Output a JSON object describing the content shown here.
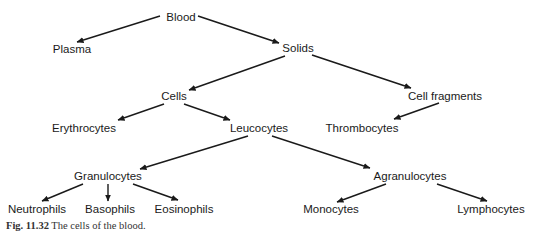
{
  "diagram": {
    "title": "The cells of the blood",
    "nodes": {
      "blood": {
        "label": "Blood",
        "x": 181,
        "y": 17
      },
      "plasma": {
        "label": "Plasma",
        "x": 72,
        "y": 49
      },
      "solids": {
        "label": "Solids",
        "x": 298,
        "y": 48
      },
      "cells": {
        "label": "Cells",
        "x": 174,
        "y": 96
      },
      "cell_fragments": {
        "label": "Cell fragments",
        "x": 445,
        "y": 96
      },
      "erythrocytes": {
        "label": "Erythrocytes",
        "x": 84,
        "y": 128
      },
      "leucocytes": {
        "label": "Leucocytes",
        "x": 259,
        "y": 128
      },
      "thrombocytes": {
        "label": "Thrombocytes",
        "x": 362,
        "y": 128
      },
      "granulocytes": {
        "label": "Granulocytes",
        "x": 108,
        "y": 176
      },
      "agranulocytes": {
        "label": "Agranulocytes",
        "x": 410,
        "y": 176
      },
      "neutrophils": {
        "label": "Neutrophils",
        "x": 37,
        "y": 209
      },
      "basophils": {
        "label": "Basophils",
        "x": 110,
        "y": 209
      },
      "eosinophils": {
        "label": "Eosinophils",
        "x": 184,
        "y": 209
      },
      "monocytes": {
        "label": "Monocytes",
        "x": 331,
        "y": 209
      },
      "lymphocytes": {
        "label": "Lymphocytes",
        "x": 491,
        "y": 209
      }
    },
    "edges": [
      {
        "from": "blood",
        "to": "plasma",
        "x1": 160,
        "y1": 16,
        "x2": 77,
        "y2": 42
      },
      {
        "from": "blood",
        "to": "solids",
        "x1": 198,
        "y1": 16,
        "x2": 279,
        "y2": 43
      },
      {
        "from": "solids",
        "to": "cells",
        "x1": 285,
        "y1": 56,
        "x2": 189,
        "y2": 90
      },
      {
        "from": "solids",
        "to": "cell_fragments",
        "x1": 312,
        "y1": 55,
        "x2": 411,
        "y2": 88
      },
      {
        "from": "cells",
        "to": "erythrocytes",
        "x1": 164,
        "y1": 104,
        "x2": 118,
        "y2": 120
      },
      {
        "from": "cells",
        "to": "leucocytes",
        "x1": 184,
        "y1": 104,
        "x2": 230,
        "y2": 120
      },
      {
        "from": "cell_fragments",
        "to": "thrombocytes",
        "x1": 439,
        "y1": 103,
        "x2": 394,
        "y2": 119
      },
      {
        "from": "leucocytes",
        "to": "granulocytes",
        "x1": 248,
        "y1": 136,
        "x2": 140,
        "y2": 169
      },
      {
        "from": "leucocytes",
        "to": "agranulocytes",
        "x1": 272,
        "y1": 136,
        "x2": 370,
        "y2": 168
      },
      {
        "from": "granulocytes",
        "to": "neutrophils",
        "x1": 83,
        "y1": 184,
        "x2": 42,
        "y2": 201
      },
      {
        "from": "granulocytes",
        "to": "basophils",
        "x1": 108,
        "y1": 184,
        "x2": 108,
        "y2": 201
      },
      {
        "from": "granulocytes",
        "to": "eosinophils",
        "x1": 133,
        "y1": 184,
        "x2": 178,
        "y2": 200
      },
      {
        "from": "agranulocytes",
        "to": "monocytes",
        "x1": 386,
        "y1": 184,
        "x2": 337,
        "y2": 202
      },
      {
        "from": "agranulocytes",
        "to": "lymphocytes",
        "x1": 437,
        "y1": 184,
        "x2": 487,
        "y2": 201
      }
    ],
    "line_color": "#1a1a1a"
  },
  "caption": {
    "figure_number": "Fig. 11.32",
    "text": "The cells of the blood."
  }
}
